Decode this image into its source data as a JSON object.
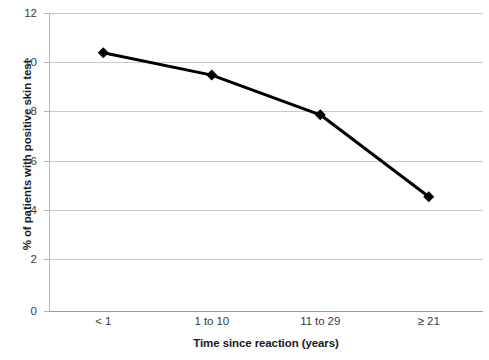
{
  "chart_data": {
    "type": "line",
    "title": "",
    "subtitle": "",
    "xlabel": "Time since reaction (years)",
    "ylabel": "% of patients with positive skin test",
    "categories": [
      "< 1",
      "1 to 10",
      "11 to 29",
      "≥ 21"
    ],
    "values": [
      10.4,
      9.5,
      7.9,
      4.6
    ],
    "series": [
      {
        "name": "% of patients with positive skin test",
        "values": [
          10.4,
          9.5,
          7.9,
          4.6
        ]
      }
    ],
    "ylim": [
      0,
      12
    ],
    "ytick_labels": [
      "0",
      "2",
      "4",
      "6",
      "8",
      "10",
      "12"
    ],
    "ytick_values": [
      0,
      2,
      4,
      6,
      8,
      10,
      12
    ],
    "grid": "horizontal",
    "legend": "none",
    "marker": "diamond",
    "line_color": "#000000",
    "marker_color": "#000000",
    "gridline_color": "#c9c9c9",
    "background_color": "#ffffff"
  },
  "axis": {
    "y_title": "% of patients with positive skin test",
    "x_title": "Time since reaction (years)",
    "y_ticks": [
      {
        "label": "12"
      },
      {
        "label": "10"
      },
      {
        "label": "8"
      },
      {
        "label": "6"
      },
      {
        "label": "4"
      },
      {
        "label": "2"
      },
      {
        "label": "0"
      }
    ],
    "x_ticks": [
      {
        "label": "< 1"
      },
      {
        "label": "1 to 10"
      },
      {
        "label": "11 to 29"
      },
      {
        "label": "≥ 21"
      }
    ]
  }
}
